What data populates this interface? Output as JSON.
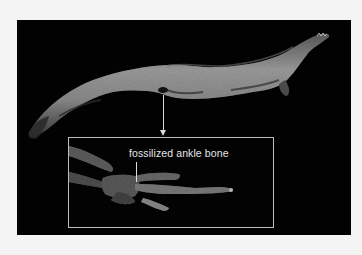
{
  "figure": {
    "background_color": "#f4f4f4",
    "panel_color": "#020202",
    "main_subject": "fossil-tetrapodomorph-body",
    "pointer": {
      "style": "arrow-down",
      "color": "#d8d8d8"
    },
    "inset": {
      "subject": "fossil-limb-bones",
      "border_color": "#bdbdbd",
      "label": "fossilized ankle bone",
      "label_color": "#e6e6e6"
    }
  }
}
